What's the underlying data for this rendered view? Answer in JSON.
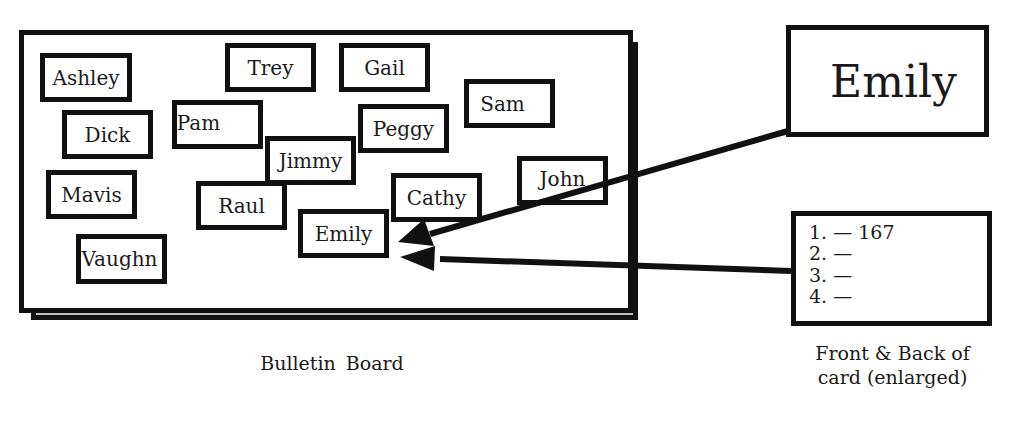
{
  "board": {
    "label": "Bulletin Board",
    "cards": [
      {
        "name": "Ashley"
      },
      {
        "name": "Trey"
      },
      {
        "name": "Gail"
      },
      {
        "name": "Sam"
      },
      {
        "name": "Pam"
      },
      {
        "name": "Dick"
      },
      {
        "name": "Peggy"
      },
      {
        "name": "Jimmy"
      },
      {
        "name": "Mavis"
      },
      {
        "name": "Raul"
      },
      {
        "name": "Cathy"
      },
      {
        "name": "John"
      },
      {
        "name": "Emily"
      },
      {
        "name": "Vaughn"
      }
    ]
  },
  "enlarged_card": {
    "front_name": "Emily",
    "back_lines": [
      "1. — 167",
      "2. —",
      "3. —",
      "4. —"
    ],
    "caption_line1": "Front & Back of",
    "caption_line2": "card (enlarged)"
  },
  "colors": {
    "ink": "#111111",
    "shadow_fill": "#bdbdbd",
    "background": "#ffffff"
  }
}
